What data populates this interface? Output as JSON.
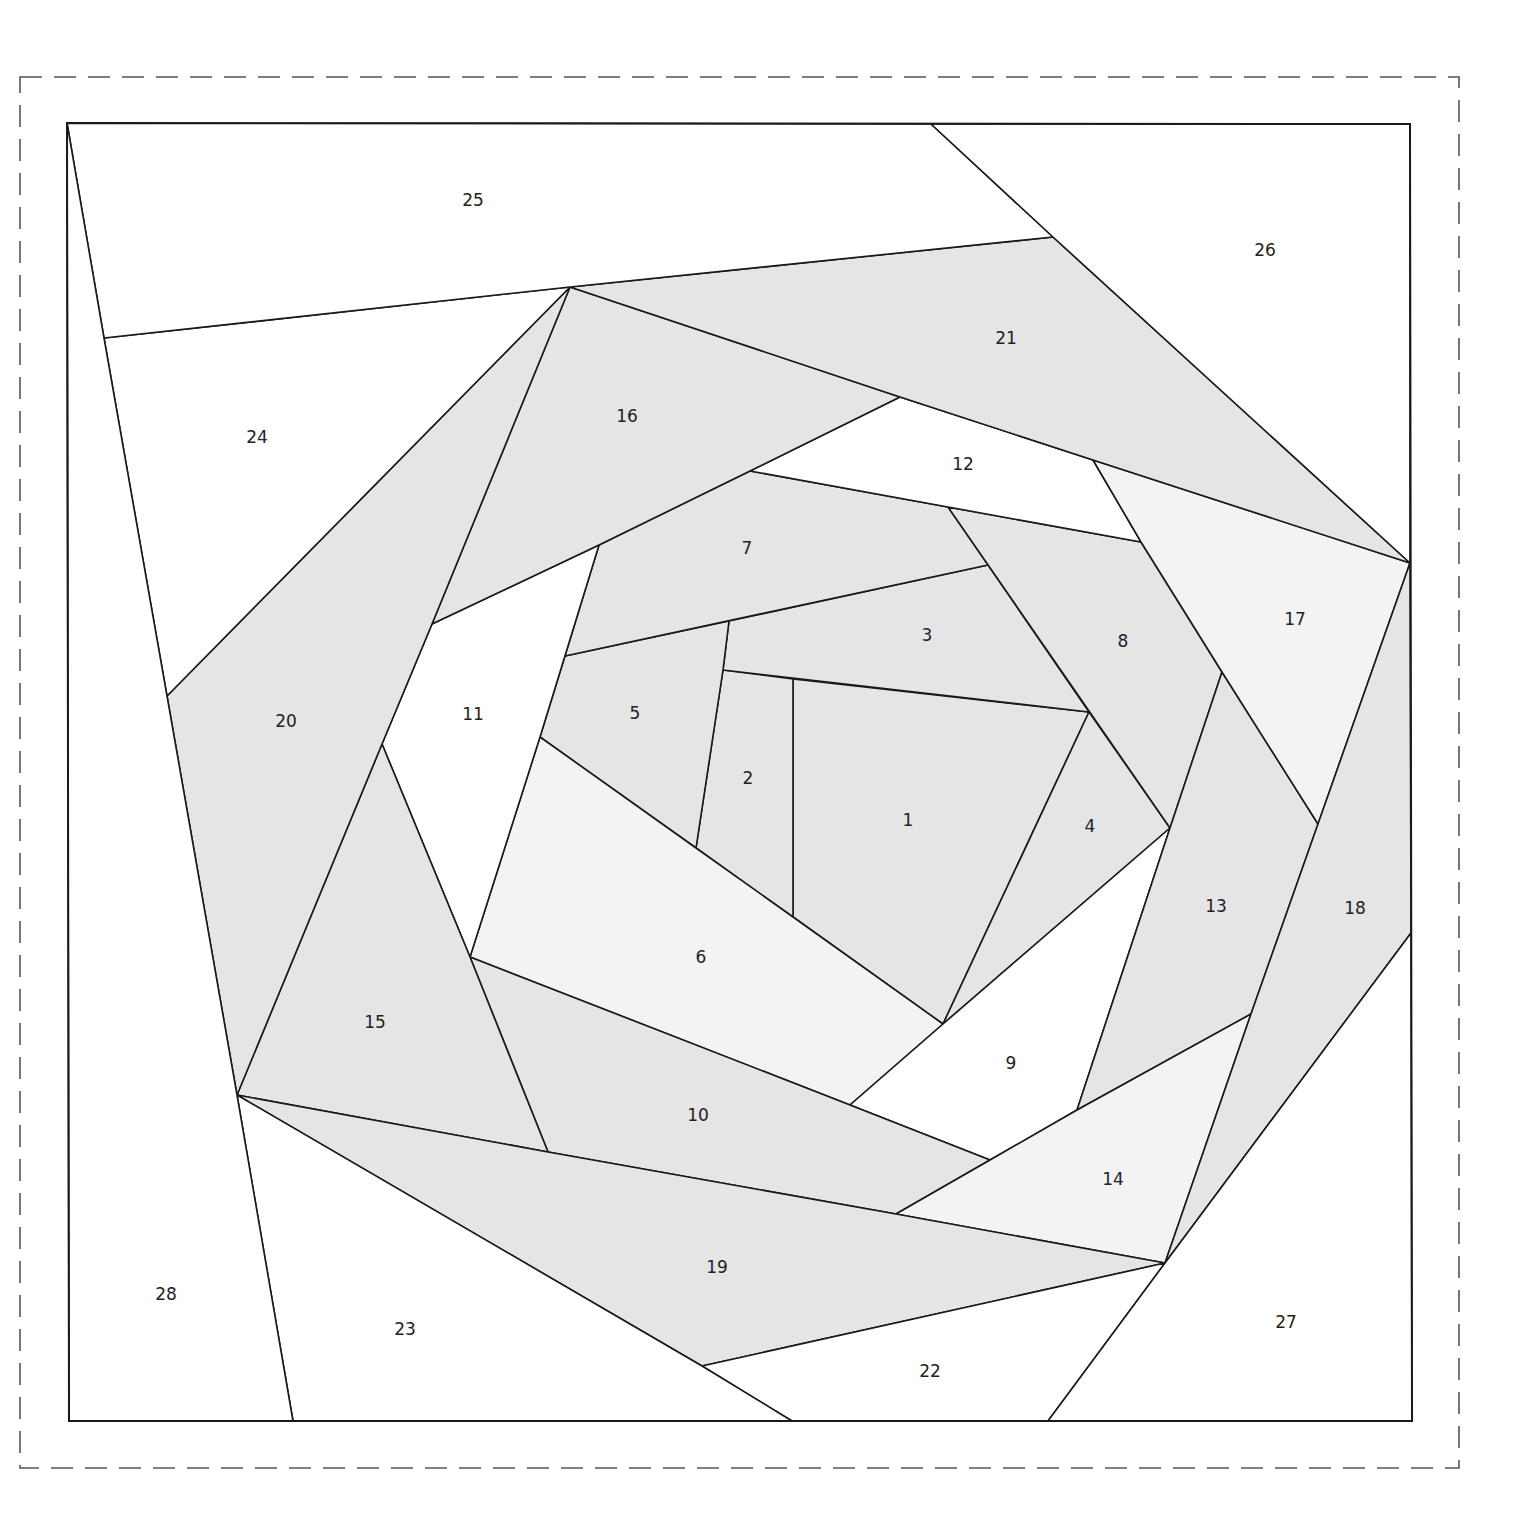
{
  "diagram": {
    "type": "paper-piecing-quilt-block",
    "colors": {
      "mid": "#e5e5e5",
      "light": "#f3f3f3",
      "white": "#ffffff",
      "line": "#1a1a1a",
      "seam_allowance": "#555555"
    },
    "seam_allowance_border": {
      "x1": 20,
      "y1": 77,
      "x2": 1459,
      "y2": 1468
    },
    "block_frame": {
      "points": "67,123 1410,124 1412,1421 69,1421"
    },
    "pieces": [
      {
        "id": "1",
        "label": "1",
        "fill": "mid",
        "points": "793,679 1089,712 943,1024 793,917",
        "lx": 908,
        "ly": 821
      },
      {
        "id": "2",
        "label": "2",
        "fill": "mid",
        "points": "723,670 793,679 793,917 696,848",
        "lx": 748,
        "ly": 779
      },
      {
        "id": "3",
        "label": "3",
        "fill": "mid",
        "points": "729,621 988,565 1089,712 723,670",
        "lx": 927,
        "ly": 636
      },
      {
        "id": "4",
        "label": "4",
        "fill": "mid",
        "points": "1089,712 1170,828 943,1024",
        "lx": 1090,
        "ly": 827
      },
      {
        "id": "5",
        "label": "5",
        "fill": "mid",
        "points": "565,656 729,621 723,670 696,848 540,737",
        "lx": 635,
        "ly": 714
      },
      {
        "id": "6",
        "label": "6",
        "fill": "light",
        "points": "540,737 696,848 793,917 943,1024 850,1105 470,957",
        "lx": 701,
        "ly": 958
      },
      {
        "id": "7",
        "label": "7",
        "fill": "mid",
        "points": "750,471 948,507 988,565 565,656 599,545",
        "lx": 747,
        "ly": 549
      },
      {
        "id": "8",
        "label": "8",
        "fill": "mid",
        "points": "948,507 1141,542 1222,672 1170,828",
        "lx": 1123,
        "ly": 642
      },
      {
        "id": "9",
        "label": "9",
        "fill": "white",
        "points": "943,1024 1170,828 1077,1110 990,1160 850,1105",
        "lx": 1011,
        "ly": 1064
      },
      {
        "id": "10",
        "label": "10",
        "fill": "mid",
        "points": "470,957 850,1105 990,1160 896,1214 548,1152",
        "lx": 698,
        "ly": 1116
      },
      {
        "id": "11",
        "label": "11",
        "fill": "white",
        "points": "432,624 599,545 540,737 470,957 382,744",
        "lx": 473,
        "ly": 715
      },
      {
        "id": "12",
        "label": "12",
        "fill": "white",
        "points": "900,397 1093,460 1141,542 948,507 750,471",
        "lx": 963,
        "ly": 465
      },
      {
        "id": "13",
        "label": "13",
        "fill": "mid",
        "points": "1170,828 1222,672 1318,824 1251,1014 1077,1110",
        "lx": 1216,
        "ly": 907
      },
      {
        "id": "14",
        "label": "14",
        "fill": "light",
        "points": "1251,1014 1165,1263 896,1214 990,1160 1077,1110",
        "lx": 1113,
        "ly": 1180
      },
      {
        "id": "15",
        "label": "15",
        "fill": "mid",
        "points": "382,744 470,957 548,1152 237,1095",
        "lx": 375,
        "ly": 1023
      },
      {
        "id": "16",
        "label": "16",
        "fill": "mid",
        "points": "570,287 900,397 750,471 599,545 432,624",
        "lx": 627,
        "ly": 417
      },
      {
        "id": "17",
        "label": "17",
        "fill": "light",
        "points": "1093,460 1410,563 1318,824 1222,672 1141,542",
        "lx": 1295,
        "ly": 620
      },
      {
        "id": "18",
        "label": "18",
        "fill": "mid",
        "points": "1410,563 1411,933 1165,1263 1251,1014 1318,824",
        "lx": 1355,
        "ly": 909
      },
      {
        "id": "19",
        "label": "19",
        "fill": "mid",
        "points": "237,1095 548,1152 896,1214 1165,1263 702,1366",
        "lx": 717,
        "ly": 1268
      },
      {
        "id": "20",
        "label": "20",
        "fill": "mid",
        "points": "570,287 432,624 382,744 237,1095 167,696",
        "lx": 286,
        "ly": 722
      },
      {
        "id": "21",
        "label": "21",
        "fill": "mid",
        "points": "570,287 1053,237 1410,563 1093,460 900,397",
        "lx": 1006,
        "ly": 339
      },
      {
        "id": "22",
        "label": "22",
        "fill": "white",
        "points": "702,1366 1165,1263 1048,1421 792,1421",
        "lx": 930,
        "ly": 1372
      },
      {
        "id": "23",
        "label": "23",
        "fill": "white",
        "points": "237,1095 702,1366 792,1421 293,1421",
        "lx": 405,
        "ly": 1330
      },
      {
        "id": "24",
        "label": "24",
        "fill": "white",
        "points": "104,338 570,287 167,696",
        "lx": 257,
        "ly": 438
      },
      {
        "id": "25",
        "label": "25",
        "fill": "white",
        "points": "67,123 931,124 1053,237 570,287 104,338",
        "lx": 473,
        "ly": 201
      },
      {
        "id": "26",
        "label": "26",
        "fill": "white",
        "points": "931,124 1410,124 1410,563 1053,237",
        "lx": 1265,
        "ly": 251
      },
      {
        "id": "27",
        "label": "27",
        "fill": "white",
        "points": "1411,933 1412,1421 1048,1421 1165,1263",
        "lx": 1286,
        "ly": 1323
      },
      {
        "id": "28",
        "label": "28",
        "fill": "white",
        "points": "67,123 104,338 167,696 237,1095 293,1421 69,1421",
        "lx": 166,
        "ly": 1295
      }
    ]
  }
}
